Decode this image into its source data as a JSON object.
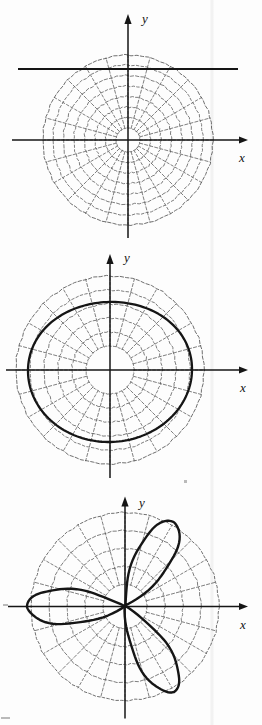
{
  "figure": {
    "kind": "polar-coordinate-grid-figures",
    "panel_count": 3,
    "axis_labels": {
      "x": "x",
      "y": "y"
    },
    "ink_color": "#151515",
    "grid_color": "#5a5a5a",
    "background_color": "#fdfdfd"
  },
  "chart_data": [
    {
      "type": "line",
      "title": "",
      "subtitle": "",
      "coordinate_system": "polar",
      "panel": "top",
      "xlabel": "x",
      "ylabel": "y",
      "grid": true,
      "grid_style": "dotted-dashed",
      "polar_grid": {
        "rings": 8,
        "ring_radii": [
          12,
          22.5,
          33,
          43.5,
          54,
          64.5,
          75,
          85
        ],
        "spokes": 24,
        "spoke_step_deg": 15,
        "max_radius": 85
      },
      "center_px": {
        "x": 128,
        "y": 140
      },
      "axis_ranges": {
        "x": [
          -100,
          110
        ],
        "y": [
          -102,
          112
        ]
      },
      "curve": {
        "name": "horizontal line",
        "equation_polar": "r = c csc(theta)",
        "description": "straight horizontal line above the origin crossing the entire grid",
        "y_value": 69,
        "x_extent": [
          18,
          238
        ],
        "stroke_width": 2.1
      },
      "legend": null,
      "annotations": []
    },
    {
      "type": "line",
      "title": "",
      "subtitle": "",
      "coordinate_system": "polar",
      "panel": "middle",
      "xlabel": "x",
      "ylabel": "y",
      "grid": true,
      "grid_style": "dotted-dashed",
      "polar_grid": {
        "rings": 6,
        "ring_radii": [
          24,
          38,
          52,
          66,
          80,
          94
        ],
        "spokes": 24,
        "spoke_step_deg": 15,
        "max_radius": 94
      },
      "center_px": {
        "x": 110,
        "y": 128
      },
      "axis_ranges": {
        "x": [
          -106,
          140
        ],
        "y": [
          -112,
          112
        ]
      },
      "curve": {
        "name": "limacon",
        "equation_polar": "r = a + b cos(theta)",
        "description": "closed oval curve centered on the origin, slightly wider than tall",
        "radius_x": 82,
        "radius_y": 72,
        "stroke_width": 2.3
      },
      "legend": null,
      "annotations": []
    },
    {
      "type": "line",
      "title": "",
      "subtitle": "",
      "coordinate_system": "polar",
      "panel": "bottom",
      "xlabel": "x",
      "ylabel": "y",
      "grid": true,
      "grid_style": "dotted-dashed",
      "polar_grid": {
        "rings": 5,
        "ring_radii": [
          22,
          40,
          58,
          76,
          94
        ],
        "spokes": 24,
        "spoke_step_deg": 15,
        "max_radius": 94
      },
      "center_px": {
        "x": 125,
        "y": 122
      },
      "axis_ranges": {
        "x": [
          -112,
          128
        ],
        "y": [
          -110,
          112
        ]
      },
      "curve": {
        "name": "three-petal rose",
        "equation_polar": "r = a cos(3 theta)",
        "description": "rose with three petals pointing toward 60 degrees, 180 degrees and 300 degrees",
        "petal_count": 3,
        "petal_angles_deg": [
          60,
          180,
          300
        ],
        "petal_length": 98,
        "stroke_width": 2.4
      },
      "legend": null,
      "annotations": []
    }
  ]
}
